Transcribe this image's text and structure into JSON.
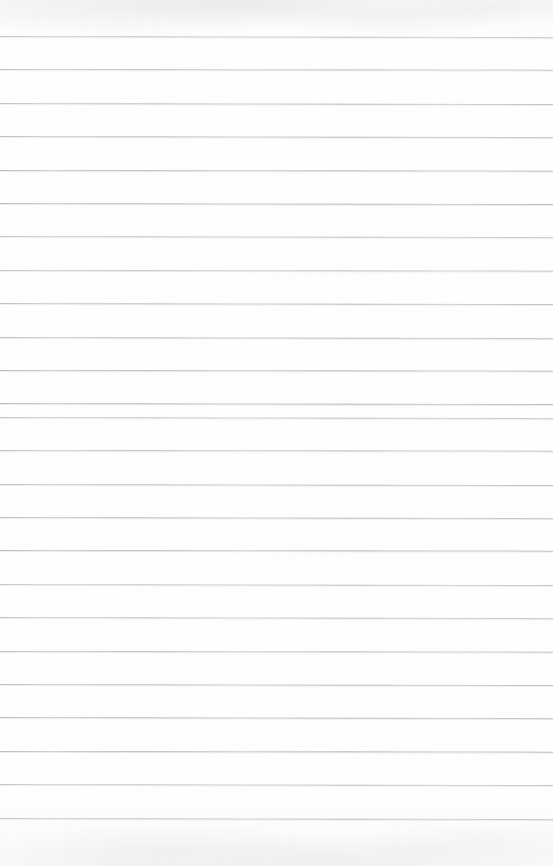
{
  "document": {
    "kind": "ruled-notebook-paper-scan",
    "title": "Blank ruled paper",
    "content_text": "",
    "has_handwriting": false,
    "has_printed_text": false,
    "orientation": "portrait"
  },
  "page": {
    "width": 553,
    "height": 866,
    "background_color": "#fefefe",
    "paper_tone": "#ffffff"
  },
  "rules": {
    "label": "horizontal ruled lines",
    "color": "#b0b5be",
    "line_thickness_px": 1,
    "spacing_px": 33.4,
    "first_line_y": 36,
    "count": 24,
    "slant_deg": 0.12,
    "left_margin_line": false,
    "right_margin_line": false,
    "positions_y": [
      36,
      69.4,
      102.8,
      136.2,
      169.6,
      203,
      236.4,
      269.8,
      303.2,
      336.6,
      370,
      403.4,
      416.8,
      450.2,
      483.6,
      517,
      550.4,
      583.8,
      617.2,
      650.6,
      684,
      717.4,
      750.8,
      784.2,
      817.6
    ]
  },
  "margins": {
    "top_blank_px": 36,
    "bottom_blank_px": 38
  },
  "artifacts": {
    "top_shading": "light gray scan mottling across the top edge",
    "bottom_shading": "light gray scan mottling across the bottom edge",
    "vertical_banding": "faint vertical scanner banding"
  }
}
